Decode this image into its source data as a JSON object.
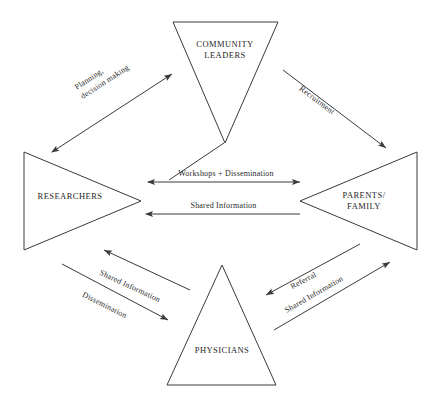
{
  "diagram": {
    "background_color": "#ffffff",
    "stroke_color": "#3a3a3a",
    "text_color": "#262626",
    "nodes": [
      {
        "id": "community-leaders",
        "label": "COMMUNITY\nLEADERS",
        "shape": "triangle",
        "direction": "down",
        "position": "top"
      },
      {
        "id": "researchers",
        "label": "RESEARCHERS",
        "shape": "triangle",
        "direction": "right",
        "position": "left"
      },
      {
        "id": "parents-family",
        "label": "PARENTS/\nFAMILY",
        "shape": "triangle",
        "direction": "left",
        "position": "right"
      },
      {
        "id": "physicians",
        "label": "PHYSICIANS",
        "shape": "triangle",
        "direction": "up",
        "position": "bottom"
      }
    ],
    "edges": [
      {
        "id": "researchers-community-leaders",
        "label": "Planning,\ndecision making",
        "from": "researchers",
        "to": "community-leaders",
        "arrowheads": "both"
      },
      {
        "id": "community-leaders-parents",
        "label": "Recruitment",
        "from": "community-leaders",
        "to": "parents-family",
        "arrowheads": "end"
      },
      {
        "id": "researchers-community-workshops",
        "label": "Workshops + Dissemination",
        "from": "researchers",
        "to": "parents-family",
        "arrowheads": "both"
      },
      {
        "id": "parents-researchers-shared",
        "label": "Shared Information",
        "from": "parents-family",
        "to": "researchers",
        "arrowheads": "start"
      },
      {
        "id": "physicians-researchers-shared",
        "label": "Shared Information",
        "from": "physicians",
        "to": "researchers",
        "arrowheads": "start"
      },
      {
        "id": "researchers-physicians-dissemination",
        "label": "Dissemination",
        "from": "researchers",
        "to": "physicians",
        "arrowheads": "end"
      },
      {
        "id": "parents-physicians-referral",
        "label": "Referral",
        "from": "parents-family",
        "to": "physicians",
        "arrowheads": "end"
      },
      {
        "id": "physicians-parents-shared",
        "label": "Shared Information",
        "from": "physicians",
        "to": "parents-family",
        "arrowheads": "end"
      }
    ]
  }
}
